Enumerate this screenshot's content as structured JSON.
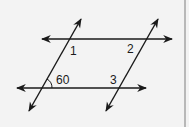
{
  "diagram": {
    "type": "parallel-lines-transversals",
    "colors": {
      "background": "#f3f3f3",
      "line": "#1a1a1a",
      "border": "#b8b8b8"
    },
    "lines": [
      {
        "id": "top-horizontal",
        "x1": 42,
        "y1": 39,
        "x2": 172,
        "y2": 39,
        "arrows": "both"
      },
      {
        "id": "bottom-horizontal",
        "x1": 17,
        "y1": 88,
        "x2": 146,
        "y2": 88,
        "arrows": "both"
      },
      {
        "id": "left-transversal",
        "x1": 29,
        "y1": 111,
        "x2": 81,
        "y2": 19,
        "arrows": "both"
      },
      {
        "id": "right-transversal",
        "x1": 106,
        "y1": 111,
        "x2": 158,
        "y2": 19,
        "arrows": "both"
      }
    ],
    "labels": {
      "angle1": "1",
      "angle2": "2",
      "angle3": "3",
      "given_angle": "60"
    }
  }
}
